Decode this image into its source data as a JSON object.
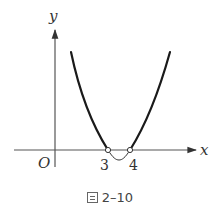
{
  "figure": {
    "axis_labels": {
      "x": "x",
      "y": "y",
      "origin": "O"
    },
    "ticks": [
      {
        "label": "3",
        "value": 3
      },
      {
        "label": "4",
        "value": 4
      }
    ],
    "curve": "parabola opening upward with roots at x = 3 and x = 4 (open circles), vertex below x-axis between 3 and 4",
    "colors": {
      "curve": "#1a1a1a",
      "axes": "#555555",
      "text": "#333333"
    }
  },
  "caption": {
    "prefix": "圖",
    "number": "2–10"
  }
}
